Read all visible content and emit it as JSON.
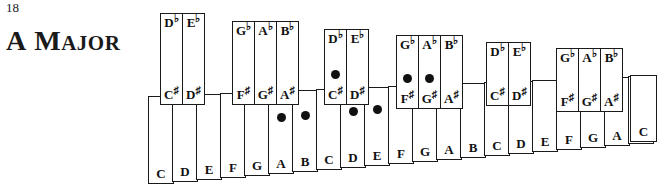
{
  "page": {
    "number": "18",
    "title_full": "A MAJOR",
    "title_first_letter": "A",
    "title_rest_cap": "M",
    "title_rest_small": "AJOR",
    "colors": {
      "ink": "#111111",
      "outline": "#1a1a1a",
      "key_fill": "#ffffff",
      "dot": "#111111",
      "background": "#ffffff"
    }
  },
  "keyboard": {
    "scale_name": "A Major",
    "marked_notes": [
      "A",
      "B",
      "C#",
      "D",
      "E",
      "F#",
      "G#"
    ],
    "white_keys": [
      {
        "label": "C",
        "octave": 1,
        "marked": false,
        "x": 148,
        "y": 96,
        "w": 26,
        "h": 88
      },
      {
        "label": "D",
        "octave": 1,
        "marked": false,
        "x": 172,
        "y": 95,
        "w": 26,
        "h": 87
      },
      {
        "label": "E",
        "octave": 1,
        "marked": false,
        "x": 196,
        "y": 94,
        "w": 26,
        "h": 86
      },
      {
        "label": "F",
        "octave": 1,
        "marked": false,
        "x": 220,
        "y": 93,
        "w": 26,
        "h": 85
      },
      {
        "label": "G",
        "octave": 1,
        "marked": false,
        "x": 244,
        "y": 92,
        "w": 26,
        "h": 84
      },
      {
        "label": "A",
        "octave": 1,
        "marked": true,
        "x": 268,
        "y": 91,
        "w": 26,
        "h": 83
      },
      {
        "label": "B",
        "octave": 1,
        "marked": true,
        "x": 292,
        "y": 90,
        "w": 26,
        "h": 82
      },
      {
        "label": "C",
        "octave": 2,
        "marked": false,
        "x": 316,
        "y": 89,
        "w": 26,
        "h": 81
      },
      {
        "label": "D",
        "octave": 2,
        "marked": true,
        "x": 340,
        "y": 88,
        "w": 26,
        "h": 80
      },
      {
        "label": "E",
        "octave": 2,
        "marked": true,
        "x": 364,
        "y": 87,
        "w": 26,
        "h": 79
      },
      {
        "label": "F",
        "octave": 2,
        "marked": false,
        "x": 388,
        "y": 86,
        "w": 26,
        "h": 78
      },
      {
        "label": "G",
        "octave": 2,
        "marked": false,
        "x": 412,
        "y": 85,
        "w": 26,
        "h": 77
      },
      {
        "label": "A",
        "octave": 2,
        "marked": true,
        "x": 436,
        "y": 84,
        "w": 26,
        "h": 76
      },
      {
        "label": "B",
        "octave": 2,
        "marked": false,
        "x": 460,
        "y": 83,
        "w": 26,
        "h": 75
      },
      {
        "label": "C",
        "octave": 3,
        "marked": false,
        "x": 484,
        "y": 82,
        "w": 26,
        "h": 74
      },
      {
        "label": "D",
        "octave": 3,
        "marked": false,
        "x": 508,
        "y": 81,
        "w": 26,
        "h": 73
      },
      {
        "label": "E",
        "octave": 3,
        "marked": false,
        "x": 532,
        "y": 80,
        "w": 26,
        "h": 72
      },
      {
        "label": "F",
        "octave": 3,
        "marked": false,
        "x": 556,
        "y": 79,
        "w": 26,
        "h": 71
      },
      {
        "label": "G",
        "octave": 3,
        "marked": false,
        "x": 580,
        "y": 78,
        "w": 26,
        "h": 70
      },
      {
        "label": "A",
        "octave": 3,
        "marked": false,
        "x": 604,
        "y": 77,
        "w": 26,
        "h": 69
      },
      {
        "label": "B",
        "octave": 3,
        "marked": false,
        "x": 628,
        "y": 76,
        "w": 26,
        "h": 68
      },
      {
        "label": "C",
        "octave": 4,
        "marked": false,
        "x": 630,
        "y": 75,
        "w": 27,
        "h": 67
      }
    ],
    "black_keys": [
      {
        "flat": "D",
        "sharp": "C",
        "marked": false,
        "x": 160,
        "y": 13,
        "w": 23,
        "h": 92,
        "dot_y": 52
      },
      {
        "flat": "E",
        "sharp": "D",
        "marked": false,
        "x": 182,
        "y": 13,
        "w": 23,
        "h": 92,
        "dot_y": 52
      },
      {
        "flat": "G",
        "sharp": "F",
        "marked": false,
        "x": 232,
        "y": 21,
        "w": 23,
        "h": 84,
        "dot_y": 48
      },
      {
        "flat": "A",
        "sharp": "G",
        "marked": false,
        "x": 254,
        "y": 21,
        "w": 23,
        "h": 84,
        "dot_y": 48
      },
      {
        "flat": "B",
        "sharp": "A",
        "marked": false,
        "x": 276,
        "y": 21,
        "w": 23,
        "h": 84,
        "dot_y": 48
      },
      {
        "flat": "D",
        "sharp": "C",
        "marked": true,
        "x": 324,
        "y": 29,
        "w": 23,
        "h": 76,
        "dot_y": 40
      },
      {
        "flat": "E",
        "sharp": "D",
        "marked": false,
        "x": 346,
        "y": 29,
        "w": 23,
        "h": 76,
        "dot_y": 40
      },
      {
        "flat": "G",
        "sharp": "F",
        "marked": true,
        "x": 396,
        "y": 35,
        "w": 23,
        "h": 74,
        "dot_y": 38
      },
      {
        "flat": "A",
        "sharp": "G",
        "marked": true,
        "x": 418,
        "y": 35,
        "w": 23,
        "h": 74,
        "dot_y": 38
      },
      {
        "flat": "B",
        "sharp": "A",
        "marked": false,
        "x": 440,
        "y": 35,
        "w": 23,
        "h": 74,
        "dot_y": 38
      },
      {
        "flat": "D",
        "sharp": "C",
        "marked": false,
        "x": 486,
        "y": 42,
        "w": 23,
        "h": 64,
        "dot_y": 34
      },
      {
        "flat": "E",
        "sharp": "D",
        "marked": false,
        "x": 508,
        "y": 42,
        "w": 23,
        "h": 64,
        "dot_y": 34
      },
      {
        "flat": "G",
        "sharp": "F",
        "marked": false,
        "x": 556,
        "y": 48,
        "w": 23,
        "h": 64,
        "dot_y": 32
      },
      {
        "flat": "A",
        "sharp": "G",
        "marked": false,
        "x": 578,
        "y": 48,
        "w": 23,
        "h": 64,
        "dot_y": 32
      },
      {
        "flat": "B",
        "sharp": "A",
        "marked": false,
        "x": 600,
        "y": 48,
        "w": 23,
        "h": 64,
        "dot_y": 32
      }
    ]
  }
}
